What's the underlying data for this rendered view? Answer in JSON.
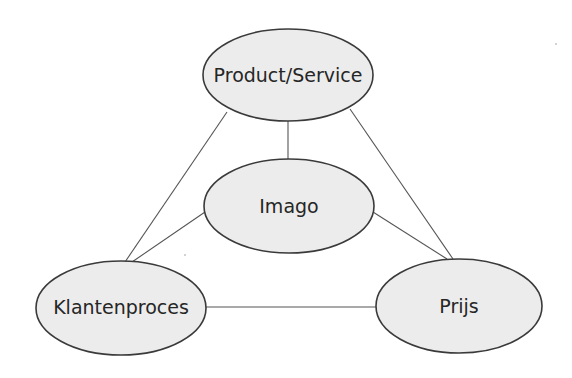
{
  "diagram": {
    "type": "relationship-triangle",
    "colors": {
      "node_fill": "#ececec",
      "node_stroke": "#3a3a3a",
      "edge": "#555555",
      "text": "#262626",
      "background": "#ffffff"
    },
    "nodes": [
      {
        "id": "product-service",
        "label": "Product/Service",
        "cx": 288,
        "cy": 75,
        "rx": 85,
        "ry": 46
      },
      {
        "id": "imago",
        "label": "Imago",
        "cx": 289,
        "cy": 206,
        "rx": 85,
        "ry": 47
      },
      {
        "id": "klantenproces",
        "label": "Klantenproces",
        "cx": 121,
        "cy": 308,
        "rx": 85,
        "ry": 47
      },
      {
        "id": "prijs",
        "label": "Prijs",
        "cx": 459,
        "cy": 306,
        "rx": 83,
        "ry": 47
      }
    ],
    "edges": [
      {
        "from": "product-service",
        "to": "imago"
      },
      {
        "from": "product-service",
        "to": "klantenproces"
      },
      {
        "from": "product-service",
        "to": "prijs"
      },
      {
        "from": "imago",
        "to": "klantenproces"
      },
      {
        "from": "imago",
        "to": "prijs"
      },
      {
        "from": "klantenproces",
        "to": "prijs"
      }
    ]
  }
}
